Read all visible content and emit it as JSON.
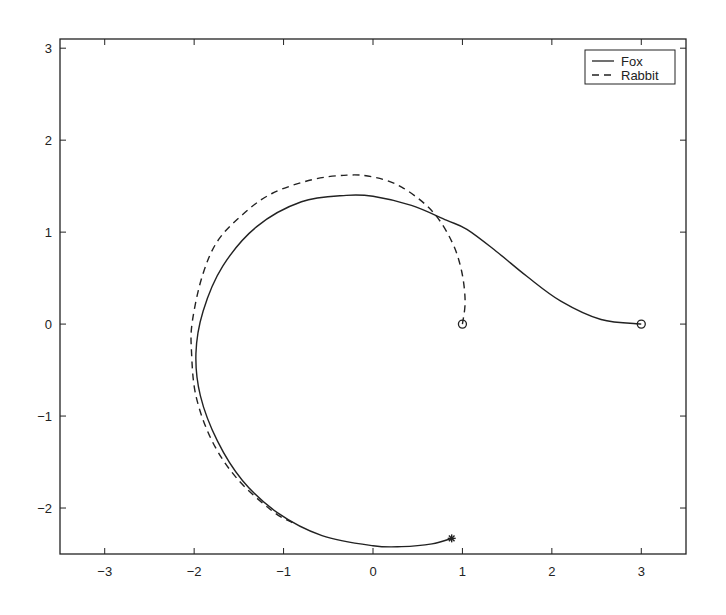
{
  "chart_data": {
    "type": "line",
    "title": "",
    "xlabel": "",
    "ylabel": "",
    "xlim": [
      -3.5,
      3.5
    ],
    "ylim": [
      -2.5,
      3.1
    ],
    "grid": false,
    "legend_position": "upper right",
    "xticks": [
      -3,
      -2,
      -1,
      0,
      1,
      2,
      3
    ],
    "yticks": [
      -2,
      -1,
      0,
      1,
      2,
      3
    ],
    "xtick_labels": [
      "-3",
      "-2",
      "-1",
      "0",
      "1",
      "2",
      "3"
    ],
    "ytick_labels": [
      "-2",
      "-1",
      "0",
      "1",
      "2",
      "3"
    ],
    "series": [
      {
        "name": "Fox",
        "style": "solid",
        "color": "#222222",
        "start_marker": "circle",
        "end_marker": "asterisk",
        "x": [
          3.0,
          2.55,
          2.1,
          1.72,
          1.38,
          1.05,
          0.82,
          0.43,
          0.0,
          -0.3,
          -0.8,
          -1.3,
          -1.68,
          -1.9,
          -1.98,
          -1.93,
          -1.74,
          -1.46,
          -1.07,
          -0.57,
          0.0,
          0.32,
          0.66,
          0.88
        ],
        "y": [
          0.0,
          0.05,
          0.25,
          0.52,
          0.79,
          1.03,
          1.13,
          1.29,
          1.39,
          1.4,
          1.33,
          1.06,
          0.63,
          0.14,
          -0.32,
          -0.78,
          -1.27,
          -1.7,
          -2.05,
          -2.3,
          -2.41,
          -2.42,
          -2.39,
          -2.33
        ]
      },
      {
        "name": "Rabbit",
        "style": "dashed",
        "color": "#222222",
        "start_marker": "circle",
        "end_marker": "",
        "x": [
          1.0,
          1.03,
          0.99,
          0.88,
          0.66,
          0.32,
          0.0,
          -0.29,
          -0.68,
          -1.13,
          -1.46,
          -1.74,
          -1.91,
          -2.02,
          -2.03,
          -1.98,
          -1.8,
          -1.52,
          -1.13,
          -0.9
        ],
        "y": [
          0.0,
          0.25,
          0.58,
          0.9,
          1.23,
          1.49,
          1.6,
          1.62,
          1.57,
          1.42,
          1.19,
          0.9,
          0.52,
          0.03,
          -0.29,
          -0.78,
          -1.27,
          -1.68,
          -2.03,
          -2.16
        ]
      }
    ],
    "legend": {
      "entries": [
        {
          "label": "Fox",
          "style": "solid"
        },
        {
          "label": "Rabbit",
          "style": "dashed"
        }
      ]
    }
  },
  "legend": {
    "fox_label": "Fox",
    "rabbit_label": "Rabbit"
  }
}
